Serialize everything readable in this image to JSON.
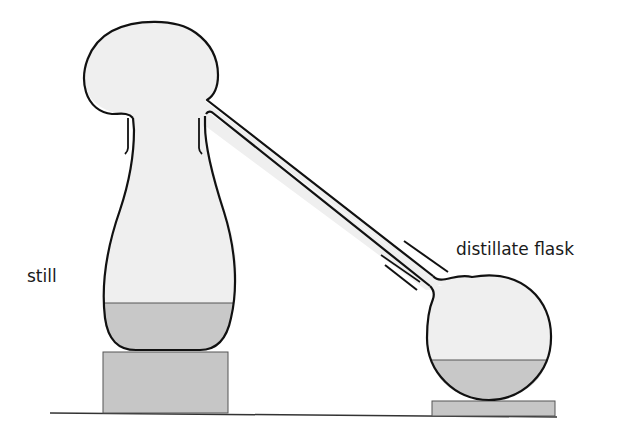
{
  "diagram": {
    "labels": {
      "still": "still",
      "distillate_flask": "distillate flask"
    },
    "components": [
      {
        "id": "still",
        "label": "still",
        "shape": "pear-shaped vessel with bulbous head"
      },
      {
        "id": "condenser-tube",
        "label": "",
        "shape": "long sloping delivery tube"
      },
      {
        "id": "distillate-flask",
        "label": "distillate flask",
        "shape": "round-bottom flask"
      },
      {
        "id": "still-stand",
        "label": "",
        "shape": "rectangular block"
      },
      {
        "id": "flask-stand",
        "label": "",
        "shape": "flat rectangular block"
      },
      {
        "id": "bench",
        "label": "",
        "shape": "horizontal line"
      }
    ],
    "colors": {
      "glass": "#efefef",
      "liquid": "#c8c8c8",
      "stand": "#c6c6c6",
      "outline": "#111111",
      "background": "#ffffff"
    }
  }
}
